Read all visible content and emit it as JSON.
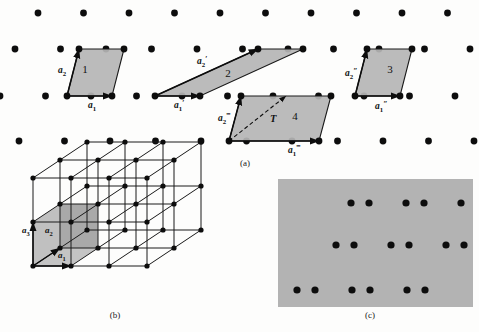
{
  "figure": {
    "captions": {
      "a": "(a)",
      "b": "(b)",
      "c": "(c)"
    },
    "colors": {
      "dot": "#0d0d0d",
      "cell_fill": "#b5b5b5",
      "cell_stroke": "#1a1a1a",
      "panel_fill": "#b3b3b3",
      "background": "#fdfdfc",
      "vector_arrow": "#0d0d0d"
    }
  },
  "panel_a": {
    "label": "(a)",
    "description": "Oblique two-dimensional Bravais lattice of points with four shaded primitive/non-primitive cells",
    "lattice": {
      "rows": 4,
      "row_y": [
        13,
        49,
        96,
        141
      ],
      "row_x_start": [
        38,
        15,
        0,
        19
      ],
      "spacing_x": 45.5,
      "dot_radius": 3.4,
      "dots_per_row": 11
    },
    "cells": [
      {
        "id": "cell-1",
        "number": "1",
        "number_pos": [
          85,
          73
        ],
        "vertices": [
          [
            67,
            96
          ],
          [
            79,
            49
          ],
          [
            124,
            49
          ],
          [
            112,
            96
          ]
        ],
        "vectors": [
          {
            "name": "a1",
            "label": "a",
            "sub": "1",
            "prime": "",
            "from": [
              67,
              96
            ],
            "to": [
              112,
              96
            ],
            "label_pos": [
              88,
              108
            ]
          },
          {
            "name": "a2",
            "label": "a",
            "sub": "2",
            "prime": "",
            "from": [
              67,
              96
            ],
            "to": [
              79,
              49
            ],
            "label_pos": [
              58,
              73
            ]
          }
        ]
      },
      {
        "id": "cell-2",
        "number": "2",
        "number_pos": [
          228,
          77
        ],
        "vertices": [
          [
            155,
            96
          ],
          [
            258,
            49
          ],
          [
            303,
            49
          ],
          [
            200,
            96
          ]
        ],
        "vectors": [
          {
            "name": "a1-prime",
            "label": "a",
            "sub": "1",
            "prime": "′",
            "from": [
              155,
              96
            ],
            "to": [
              200,
              96
            ],
            "label_pos": [
              174,
              108
            ]
          },
          {
            "name": "a2-prime",
            "label": "a",
            "sub": "2",
            "prime": "′",
            "from": [
              155,
              96
            ],
            "to": [
              258,
              49
            ],
            "label_pos": [
              197,
              64
            ]
          }
        ]
      },
      {
        "id": "cell-3",
        "number": "3",
        "number_pos": [
          390,
          73
        ],
        "vertices": [
          [
            355,
            96
          ],
          [
            367,
            49
          ],
          [
            412,
            49
          ],
          [
            400,
            96
          ]
        ],
        "vectors": [
          {
            "name": "a1-dprime",
            "label": "a",
            "sub": "1",
            "prime": "″",
            "from": [
              355,
              96
            ],
            "to": [
              400,
              96
            ],
            "label_pos": [
              375,
              109
            ]
          },
          {
            "name": "a2-dprime",
            "label": "a",
            "sub": "2",
            "prime": "″",
            "from": [
              355,
              96
            ],
            "to": [
              367,
              49
            ],
            "label_pos": [
              345,
              76
            ]
          }
        ]
      },
      {
        "id": "cell-4",
        "number": "4",
        "number_pos": [
          295,
          120
        ],
        "vertices": [
          [
            229,
            141
          ],
          [
            241,
            96
          ],
          [
            331,
            96
          ],
          [
            319,
            141
          ]
        ],
        "vectors": [
          {
            "name": "a1-tprime",
            "label": "a",
            "sub": "1",
            "prime": "‴",
            "from": [
              229,
              141
            ],
            "to": [
              319,
              141
            ],
            "label_pos": [
              288,
              153
            ]
          },
          {
            "name": "a2-tprime",
            "label": "a",
            "sub": "2",
            "prime": "‴",
            "from": [
              229,
              141
            ],
            "to": [
              241,
              96
            ],
            "label_pos": [
              218,
              121
            ]
          },
          {
            "name": "T-translation",
            "label": "T",
            "sub": "",
            "prime": "",
            "from": [
              229,
              141
            ],
            "to": [
              286,
              96
            ],
            "label_pos": [
              270,
              122
            ],
            "dashed": true
          }
        ]
      }
    ]
  },
  "panel_b": {
    "label": "(b)",
    "description": "Three-dimensional Bravais lattice drawn as a 3x2x2 array of cells with one shaded unit cell",
    "grid": {
      "nx": 3,
      "ny": 2,
      "nz": 2,
      "origin": [
        33,
        266
      ],
      "vec_a1": [
        38,
        0
      ],
      "vec_a2": [
        27,
        -18
      ],
      "vec_a3": [
        0,
        -44
      ],
      "dot_radius": 2.6
    },
    "vectors": [
      {
        "name": "a3",
        "label": "a",
        "sub": "3",
        "label_pos": [
          22,
          233
        ]
      },
      {
        "name": "a2",
        "label": "a",
        "sub": "2",
        "label_pos": [
          45,
          233
        ]
      },
      {
        "name": "a1",
        "label": "a",
        "sub": "1",
        "label_pos": [
          58,
          258
        ]
      }
    ]
  },
  "panel_c": {
    "label": "(c)",
    "description": "Gray panel showing a lattice with a two-point basis: pairs of dots arranged in three rows",
    "panel": {
      "x": 278,
      "y": 179,
      "width": 195,
      "height": 128
    },
    "dots": {
      "rows": 3,
      "row_y": [
        203,
        245,
        290
      ],
      "row_x_start": [
        351,
        336,
        297
      ],
      "pair_gap": 18,
      "cell_spacing": 55,
      "pairs_per_row": 3,
      "dot_radius": 3.6
    }
  }
}
